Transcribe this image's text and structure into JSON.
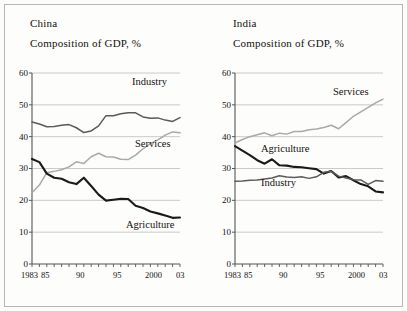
{
  "figure": {
    "background": "#fcfcfa",
    "frame_color": "#b9b6b0"
  },
  "colors": {
    "agriculture": "#1a1a1a",
    "industry": "#5a5a5a",
    "services": "#a9a9a9",
    "gridline": "#bdbdbd",
    "axis": "#555555",
    "text": "#14110f"
  },
  "panels": [
    {
      "id": "china",
      "name": "China",
      "subtitle": "Composition of GDP, %",
      "y_ticks": [
        "60",
        "50",
        "40",
        "30",
        "20",
        "10",
        "0"
      ],
      "x_ticks": [
        "1983",
        "85",
        "90",
        "95",
        "2000",
        "03"
      ],
      "series_labels": [
        {
          "name": "Industry",
          "text": "Industry"
        },
        {
          "name": "Services",
          "text": "Services"
        },
        {
          "name": "Agriculture",
          "text": "Agriculture"
        }
      ]
    },
    {
      "id": "india",
      "name": "India",
      "subtitle": "Composition of GDP, %",
      "y_ticks": [
        "60",
        "50",
        "40",
        "30",
        "20",
        "10",
        "0"
      ],
      "x_ticks": [
        "1983",
        "85",
        "90",
        "95",
        "2000",
        "03"
      ],
      "series_labels": [
        {
          "name": "Services",
          "text": "Services"
        },
        {
          "name": "Agriculture",
          "text": "Agriculture"
        },
        {
          "name": "Industry",
          "text": "Industry"
        }
      ]
    }
  ],
  "chart_data": [
    {
      "type": "line",
      "title": "China",
      "subtitle": "Composition of GDP, %",
      "xlabel": "",
      "ylabel": "Composition of GDP, %",
      "xlim": [
        1983,
        2003
      ],
      "ylim": [
        0,
        60
      ],
      "yticks": [
        0,
        10,
        20,
        30,
        40,
        50,
        60
      ],
      "xticks": [
        1983,
        1985,
        1990,
        1995,
        2000,
        2003
      ],
      "xticklabels": [
        "1983",
        "85",
        "90",
        "95",
        "2000",
        "03"
      ],
      "grid": "horizontal",
      "legend": "inline-annotations",
      "x": [
        1983,
        1984,
        1985,
        1986,
        1987,
        1988,
        1989,
        1990,
        1991,
        1992,
        1993,
        1994,
        1995,
        1996,
        1997,
        1998,
        1999,
        2000,
        2001,
        2002,
        2003
      ],
      "series": [
        {
          "name": "Industry",
          "color": "#5a5a5a",
          "values": [
            44.6,
            44.0,
            43.1,
            43.2,
            43.6,
            43.8,
            42.8,
            41.3,
            41.8,
            43.4,
            46.6,
            46.6,
            47.2,
            47.5,
            47.5,
            46.2,
            45.8,
            45.9,
            45.2,
            44.8,
            46.0
          ]
        },
        {
          "name": "Services",
          "color": "#a9a9a9",
          "values": [
            22.4,
            24.8,
            28.7,
            29.1,
            29.6,
            30.5,
            32.1,
            31.6,
            33.7,
            34.8,
            33.7,
            33.6,
            32.9,
            32.8,
            34.2,
            36.2,
            37.8,
            39.0,
            40.5,
            41.5,
            41.2
          ]
        },
        {
          "name": "Agriculture",
          "color": "#1a1a1a",
          "values": [
            33.0,
            32.0,
            28.4,
            27.1,
            26.8,
            25.7,
            25.1,
            27.1,
            24.5,
            21.8,
            19.9,
            20.2,
            20.5,
            20.4,
            18.3,
            17.6,
            16.5,
            15.9,
            15.2,
            14.5,
            14.6
          ]
        }
      ]
    },
    {
      "type": "line",
      "title": "India",
      "subtitle": "Composition of GDP, %",
      "xlabel": "",
      "ylabel": "Composition of GDP, %",
      "xlim": [
        1983,
        2003
      ],
      "ylim": [
        0,
        60
      ],
      "yticks": [
        0,
        10,
        20,
        30,
        40,
        50,
        60
      ],
      "xticks": [
        1983,
        1985,
        1990,
        1995,
        2000,
        2003
      ],
      "xticklabels": [
        "1983",
        "85",
        "90",
        "95",
        "2000",
        "03"
      ],
      "grid": "horizontal",
      "legend": "inline-annotations",
      "x": [
        1983,
        1984,
        1985,
        1986,
        1987,
        1988,
        1989,
        1990,
        1991,
        1992,
        1993,
        1994,
        1995,
        1996,
        1997,
        1998,
        1999,
        2000,
        2001,
        2002,
        2003
      ],
      "series": [
        {
          "name": "Services",
          "color": "#a9a9a9",
          "values": [
            38.0,
            39.1,
            40.0,
            40.6,
            41.2,
            40.3,
            41.1,
            40.8,
            41.6,
            41.6,
            42.2,
            42.4,
            42.9,
            43.6,
            42.5,
            44.4,
            46.4,
            47.8,
            49.2,
            50.6,
            51.8
          ]
        },
        {
          "name": "Agriculture",
          "color": "#1a1a1a",
          "values": [
            37.0,
            35.6,
            34.2,
            32.6,
            31.5,
            32.9,
            31.0,
            30.9,
            30.5,
            30.4,
            30.1,
            29.8,
            28.4,
            29.2,
            27.2,
            27.6,
            26.3,
            25.1,
            24.4,
            22.8,
            22.5
          ]
        },
        {
          "name": "Industry",
          "color": "#5a5a5a",
          "values": [
            26.0,
            26.1,
            26.3,
            26.4,
            26.7,
            27.0,
            27.7,
            27.3,
            27.2,
            27.4,
            26.9,
            27.4,
            28.8,
            29.1,
            27.6,
            27.0,
            26.5,
            26.4,
            25.0,
            26.2,
            26.0
          ]
        }
      ]
    }
  ]
}
